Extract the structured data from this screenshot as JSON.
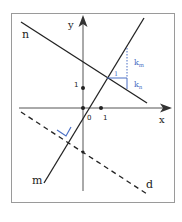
{
  "diagram": {
    "axes": {
      "x_label": "x",
      "y_label": "y",
      "origin_label": "0",
      "x_unit_label": "1",
      "y_unit_label": "1"
    },
    "lines": {
      "n": {
        "label": "n",
        "style": "solid"
      },
      "m": {
        "label": "m",
        "style": "solid"
      },
      "d": {
        "label": "d",
        "style": "dashed"
      }
    },
    "slope_triangle": {
      "run_label": "1",
      "km_label": "k",
      "km_sub": "m",
      "kn_label": "k",
      "kn_sub": "n"
    },
    "colors": {
      "line": "#222222",
      "axis": "#555555",
      "accent": "#4a6fc4",
      "frame": "#999999"
    }
  }
}
